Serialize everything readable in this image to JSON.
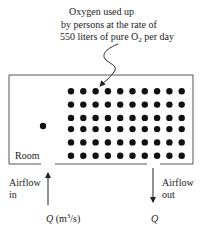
{
  "annotation": {
    "lines": [
      "Oxygen used up",
      "by persons at the rate of",
      "550 liters of pure O",
      " per day"
    ],
    "line1": "Oxygen used up",
    "line2": "by persons at the rate of",
    "line3_pre": "550 liters of pure O",
    "line3_sub": "2",
    "line3_post": " per day"
  },
  "room": {
    "label": "Room",
    "persons": {
      "rows": 6,
      "cols": 10
    },
    "single_person_count": 1
  },
  "inlet": {
    "label_line1": "Airflow",
    "label_line2": "in",
    "flow_symbol": "Q",
    "flow_unit_pre": " (m",
    "flow_unit_sup": "3",
    "flow_unit_post": "/s)"
  },
  "outlet": {
    "label_line1": "Airflow",
    "label_line2": "out",
    "flow_symbol": "Q"
  },
  "colors": {
    "ink": "#111111",
    "line": "#555555"
  }
}
